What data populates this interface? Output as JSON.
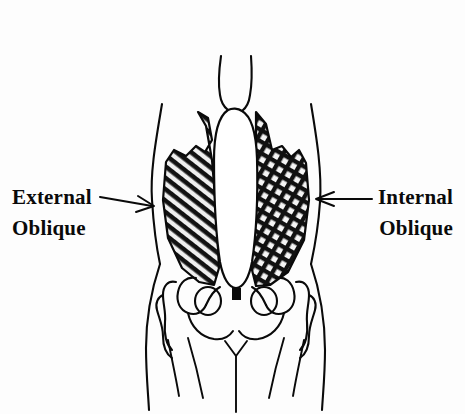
{
  "figure": {
    "kind": "anatomical-line-drawing",
    "view": "anterior",
    "background_color": "#fdfdfd",
    "ink_color": "#0a0a0a"
  },
  "labels": {
    "left": {
      "name": "external-oblique",
      "line1": "External",
      "line2": "Oblique",
      "arrow_direction": "right",
      "points_to": "left-side-muscle-panel",
      "hatching": "single diagonal"
    },
    "right": {
      "name": "internal-oblique",
      "line1": "Internal",
      "line2": "Oblique",
      "arrow_direction": "left",
      "points_to": "right-side-muscle-panel",
      "hatching": "cross hatching"
    }
  },
  "regions": [
    {
      "name": "sternum-xiphoid",
      "description": "narrow central column at top"
    },
    {
      "name": "rectus-abdominis-sheath",
      "description": "white central vertical band"
    },
    {
      "name": "external-oblique-panel",
      "description": "left hatched muscle sheet"
    },
    {
      "name": "internal-oblique-panel",
      "description": "right cross-hatched muscle sheet"
    },
    {
      "name": "pelvis",
      "description": "iliac crests, acetabula, obturator foramina, pubic symphysis"
    },
    {
      "name": "torso-outline",
      "description": "waist contour flaring to hips"
    },
    {
      "name": "thigh-lines",
      "description": "upper leg contour lines"
    },
    {
      "name": "groin-line",
      "description": "central Y-shaped crease"
    }
  ]
}
